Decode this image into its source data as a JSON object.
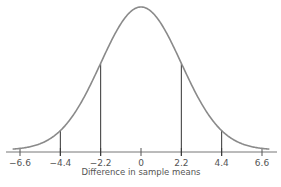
{
  "chart_data": {
    "type": "line",
    "title": "",
    "xlabel": "Difference in sample means",
    "ylabel": "",
    "mean": 0,
    "sd": 2.2,
    "xlim": [
      -6.6,
      6.6
    ],
    "x_ticks": [
      -6.6,
      -4.4,
      -2.2,
      0,
      2.2,
      4.4,
      6.6
    ],
    "tick_labels": [
      "-6.6",
      "-4.4",
      "-2.2",
      "0",
      "2.2",
      "4.4",
      "6.6"
    ],
    "vertical_lines_at": [
      -4.4,
      -2.2,
      2.2,
      4.4
    ],
    "grid": false,
    "legend": null
  },
  "axis": {
    "xlabel": "Difference in sample means",
    "ticks": [
      "-6.6",
      "-4.4",
      "-2.2",
      "0",
      "2.2",
      "4.4",
      "6.6"
    ]
  },
  "colors": {
    "curve": "#8a8a8a",
    "lines": "#333333",
    "axis": "#666666",
    "text": "#555555"
  }
}
